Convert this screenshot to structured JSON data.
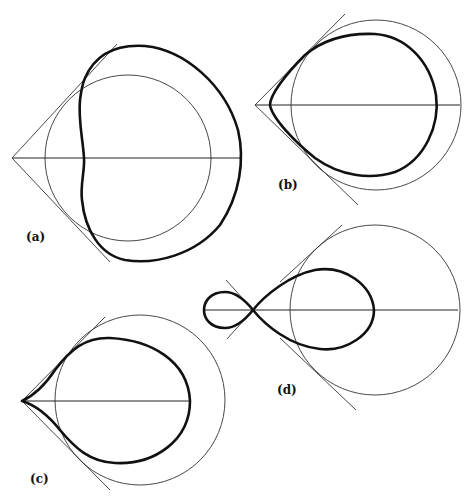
{
  "figure": {
    "panels": [
      {
        "id": "a",
        "label": "(a)",
        "description": "Dimpled closed curve with circle and tangent lines from apex"
      },
      {
        "id": "b",
        "label": "(b)",
        "description": "Rounded teardrop curve inside circle with tangent lines"
      },
      {
        "id": "c",
        "label": "(c)",
        "description": "Cusped teardrop curve with circle and tangent lines"
      },
      {
        "id": "d",
        "label": "(d)",
        "description": "Figure-eight (lemniscate-like) curve with self-intersection, circle and tangent lines"
      }
    ],
    "colors": {
      "background": "#ffffff",
      "stroke": "#111111"
    }
  }
}
